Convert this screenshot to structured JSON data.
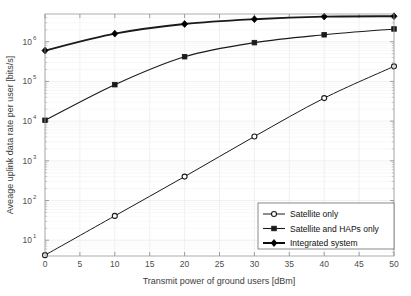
{
  "chart_data": {
    "type": "line",
    "title": "",
    "xlabel": "Transmit power of ground users [dBm]",
    "ylabel": "Aveage uplink data rate per user [bits/s]",
    "x": [
      0,
      10,
      20,
      30,
      40,
      50
    ],
    "xlim": [
      0,
      50
    ],
    "ylim": [
      4,
      5000000
    ],
    "yscale": "log",
    "xticks": [
      "0",
      "5",
      "10",
      "15",
      "20",
      "25",
      "30",
      "35",
      "40",
      "45",
      "50"
    ],
    "xtick_values": [
      0,
      5,
      10,
      15,
      20,
      25,
      30,
      35,
      40,
      45,
      50
    ],
    "yticks": [
      "10^1",
      "10^2",
      "10^3",
      "10^4",
      "10^5",
      "10^6"
    ],
    "ytick_values": [
      10,
      100,
      1000,
      10000,
      100000,
      1000000
    ],
    "ytick_base": "10",
    "ytick_exponents": [
      "1",
      "2",
      "3",
      "4",
      "5",
      "6"
    ],
    "grid": true,
    "legend_position": "lower right",
    "series": [
      {
        "name": "Satellite only",
        "marker": "circle",
        "color": "#1a1a1a",
        "linewidth": 1.0,
        "values": [
          4.2,
          41,
          400,
          4100,
          38000,
          240000
        ]
      },
      {
        "name": "Satellite and HAPs only",
        "marker": "square",
        "color": "#1a1a1a",
        "linewidth": 1.1,
        "values": [
          10500,
          83000,
          420000,
          950000,
          1500000,
          2100000
        ]
      },
      {
        "name": "Integrated system",
        "marker": "diamond",
        "color": "#000000",
        "linewidth": 1.9,
        "values": [
          600000,
          1600000,
          2800000,
          3700000,
          4300000,
          4400000
        ]
      }
    ]
  },
  "legend": {
    "entries": [
      {
        "label": "Satellite only"
      },
      {
        "label": "Satellite and HAPs only"
      },
      {
        "label": "Integrated system"
      }
    ]
  },
  "axes": {
    "x_title": "Transmit power of ground users [dBm]",
    "y_title": "Aveage uplink data rate per user [bits/s]"
  }
}
